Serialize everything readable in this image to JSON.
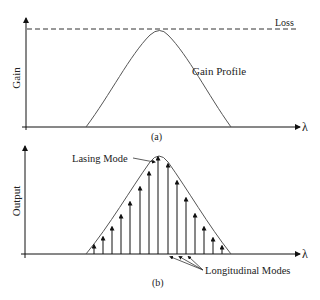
{
  "panel_a": {
    "y_label": "Gain",
    "x_label": "λ",
    "loss_label": "Loss",
    "curve_label": "Gain Profile",
    "caption": "(a)"
  },
  "panel_b": {
    "y_label": "Output",
    "x_label": "λ",
    "lasing_label": "Lasing Mode",
    "modes_label": "Longitudinal Modes",
    "caption": "(b)",
    "mode_count": 15
  },
  "colors": {
    "axis": "#111111",
    "curve": "#555555",
    "text": "#222222"
  }
}
